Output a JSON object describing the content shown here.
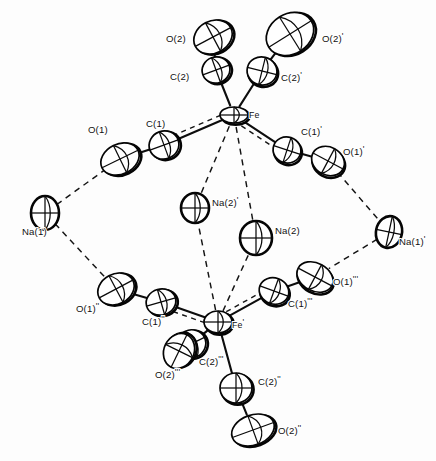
{
  "figure": {
    "name": "ortep-thermal-ellipsoid-plot",
    "type": "crystal-structure-diagram",
    "width": 436,
    "height": 461,
    "background_color": "#fdfdfd",
    "line_color": "#0d0d0d",
    "ellipsoid_fill": "#ffffff",
    "bond_style": "solid",
    "contact_style": "dashed"
  },
  "atoms": [
    {
      "id": "O2",
      "label": "O(2)",
      "element": "O",
      "cx": 213,
      "cy": 37,
      "rx": 20,
      "ry": 16,
      "rot": -28,
      "label_x": 166,
      "label_y": 42,
      "shadow": true
    },
    {
      "id": "O2p",
      "label": "O(2)",
      "prime": "'",
      "element": "O",
      "cx": 290,
      "cy": 34,
      "rx": 25,
      "ry": 20,
      "rot": -32,
      "label_x": 322,
      "label_y": 42,
      "shadow": true
    },
    {
      "id": "C2",
      "label": "C(2)",
      "element": "C",
      "cx": 216,
      "cy": 70,
      "rx": 14,
      "ry": 13,
      "rot": -20,
      "label_x": 170,
      "label_y": 80,
      "shadow": true
    },
    {
      "id": "C2p",
      "label": "C(2)",
      "prime": "'",
      "element": "C",
      "cx": 262,
      "cy": 71,
      "rx": 15,
      "ry": 14,
      "rot": 14,
      "label_x": 281,
      "label_y": 81,
      "shadow": true
    },
    {
      "id": "Fe",
      "label": "Fe",
      "element": "Fe",
      "cx": 234,
      "cy": 115,
      "rx": 14,
      "ry": 8,
      "rot": 0,
      "label_x": 249,
      "label_y": 118,
      "shadow": true
    },
    {
      "id": "C1",
      "label": "C(1)",
      "element": "C",
      "cx": 164,
      "cy": 145,
      "rx": 15,
      "ry": 14,
      "rot": -20,
      "label_x": 146,
      "label_y": 127,
      "shadow": true
    },
    {
      "id": "O1",
      "label": "O(1)",
      "element": "O",
      "cx": 120,
      "cy": 159,
      "rx": 20,
      "ry": 15,
      "rot": -26,
      "label_x": 88,
      "label_y": 133,
      "shadow": true
    },
    {
      "id": "C1p",
      "label": "C(1)",
      "prime": "'",
      "element": "C",
      "cx": 287,
      "cy": 150,
      "rx": 14,
      "ry": 13,
      "rot": 18,
      "label_x": 301,
      "label_y": 135,
      "shadow": true
    },
    {
      "id": "O1p",
      "label": "O(1)",
      "prime": "'",
      "element": "O",
      "cx": 328,
      "cy": 161,
      "rx": 17,
      "ry": 14,
      "rot": 28,
      "label_x": 343,
      "label_y": 155,
      "shadow": true
    },
    {
      "id": "Na2p",
      "label": "Na(2)",
      "prime": "'",
      "element": "Na",
      "cx": 195,
      "cy": 208,
      "rx": 14,
      "ry": 15,
      "rot": 0,
      "label_x": 212,
      "label_y": 206,
      "shadow": false
    },
    {
      "id": "Na2",
      "label": "Na(2)",
      "element": "Na",
      "cx": 256,
      "cy": 238,
      "rx": 16,
      "ry": 17,
      "rot": 0,
      "label_x": 275,
      "label_y": 234,
      "shadow": false
    },
    {
      "id": "Na1",
      "label": "Na(1)",
      "element": "Na",
      "cx": 45,
      "cy": 213,
      "rx": 14,
      "ry": 17,
      "rot": 0,
      "label_x": 22,
      "label_y": 235,
      "shadow": false
    },
    {
      "id": "Na1p",
      "label": "Na(1)",
      "prime": "'",
      "element": "Na",
      "cx": 389,
      "cy": 232,
      "rx": 13,
      "ry": 16,
      "rot": 12,
      "label_x": 399,
      "label_y": 245,
      "shadow": false
    },
    {
      "id": "O1pp",
      "label": "O(1)",
      "prime": "''",
      "element": "O",
      "cx": 116,
      "cy": 289,
      "rx": 19,
      "ry": 15,
      "rot": -28,
      "label_x": 76,
      "label_y": 312,
      "shadow": true
    },
    {
      "id": "C1pp",
      "label": "C(1)",
      "prime": "''",
      "element": "C",
      "cx": 161,
      "cy": 302,
      "rx": 15,
      "ry": 13,
      "rot": -16,
      "label_x": 142,
      "label_y": 325,
      "shadow": true
    },
    {
      "id": "Fep",
      "label": "Fe",
      "prime": "'",
      "element": "Fe",
      "cx": 218,
      "cy": 322,
      "rx": 14,
      "ry": 11,
      "rot": 0,
      "label_x": 232,
      "label_y": 328,
      "shadow": true
    },
    {
      "id": "C1ppp",
      "label": "C(1)",
      "prime": "'''",
      "element": "C",
      "cx": 274,
      "cy": 291,
      "rx": 15,
      "ry": 13,
      "rot": 20,
      "label_x": 288,
      "label_y": 307,
      "shadow": true
    },
    {
      "id": "O1ppp",
      "label": "O(1)",
      "prime": "'''",
      "element": "O",
      "cx": 315,
      "cy": 277,
      "rx": 19,
      "ry": 14,
      "rot": 28,
      "label_x": 333,
      "label_y": 285,
      "shadow": true
    },
    {
      "id": "C2ppp",
      "label": "C(2)",
      "prime": "'''",
      "element": "C",
      "cx": 191,
      "cy": 344,
      "rx": 15,
      "ry": 14,
      "rot": -26,
      "label_x": 199,
      "label_y": 365,
      "shadow": true
    },
    {
      "id": "O2ppp",
      "label": "O(2)",
      "prime": "'''",
      "element": "O",
      "cx": 179,
      "cy": 351,
      "rx": 18,
      "ry": 15,
      "rot": -64,
      "label_x": 155,
      "label_y": 378,
      "shadow": true
    },
    {
      "id": "C2pp",
      "label": "C(2)",
      "prime": "''",
      "element": "C",
      "cx": 236,
      "cy": 388,
      "rx": 16,
      "ry": 15,
      "rot": 0,
      "label_x": 258,
      "label_y": 385,
      "shadow": true
    },
    {
      "id": "O2pp",
      "label": "O(2)",
      "prime": "''",
      "element": "O",
      "cx": 253,
      "cy": 430,
      "rx": 22,
      "ry": 15,
      "rot": -20,
      "label_x": 278,
      "label_y": 434,
      "shadow": true
    }
  ],
  "bonds": [
    {
      "name": "bond-O2-C2",
      "from": "O2",
      "to": "C2",
      "style": "solid"
    },
    {
      "name": "bond-O2p-C2p",
      "from": "O2p",
      "to": "C2p",
      "style": "solid"
    },
    {
      "name": "bond-C2-Fe",
      "from": "C2",
      "to": "Fe",
      "style": "solid"
    },
    {
      "name": "bond-C2p-Fe",
      "from": "C2p",
      "to": "Fe",
      "style": "solid"
    },
    {
      "name": "bond-Fe-C1",
      "from": "Fe",
      "to": "C1",
      "style": "solid"
    },
    {
      "name": "bond-C1-O1",
      "from": "C1",
      "to": "O1",
      "style": "solid"
    },
    {
      "name": "bond-Fe-C1p",
      "from": "Fe",
      "to": "C1p",
      "style": "solid"
    },
    {
      "name": "bond-C1p-O1p",
      "from": "C1p",
      "to": "O1p",
      "style": "solid"
    },
    {
      "name": "bond-Fep-C1pp",
      "from": "Fep",
      "to": "C1pp",
      "style": "solid"
    },
    {
      "name": "bond-C1pp-O1pp",
      "from": "C1pp",
      "to": "O1pp",
      "style": "solid"
    },
    {
      "name": "bond-Fep-C1ppp",
      "from": "Fep",
      "to": "C1ppp",
      "style": "solid"
    },
    {
      "name": "bond-C1ppp-O1ppp",
      "from": "C1ppp",
      "to": "O1ppp",
      "style": "solid"
    },
    {
      "name": "bond-Fep-C2ppp",
      "from": "Fep",
      "to": "C2ppp",
      "style": "solid"
    },
    {
      "name": "bond-C2ppp-O2ppp",
      "from": "C2ppp",
      "to": "O2ppp",
      "style": "solid"
    },
    {
      "name": "bond-Fep-C2pp",
      "from": "Fep",
      "to": "C2pp",
      "style": "solid"
    },
    {
      "name": "bond-C2pp-O2pp",
      "from": "C2pp",
      "to": "O2pp",
      "style": "solid"
    }
  ],
  "contacts": [
    {
      "name": "contact-O1-Na1",
      "from": "O1",
      "to": "Na1"
    },
    {
      "name": "contact-Na1-O1pp",
      "from": "Na1",
      "to": "O1pp"
    },
    {
      "name": "contact-O1p-Na1p",
      "from": "O1p",
      "to": "Na1p"
    },
    {
      "name": "contact-Na1p-O1ppp",
      "from": "Na1p",
      "to": "O1ppp"
    },
    {
      "name": "contact-Fe-Na2p",
      "from": "Fe",
      "to": "Na2p"
    },
    {
      "name": "contact-Fe-Na2",
      "from": "Fe",
      "to": "Na2"
    },
    {
      "name": "contact-Fep-Na2p",
      "from": "Fep",
      "to": "Na2p"
    },
    {
      "name": "contact-Fep-Na2",
      "from": "Fep",
      "to": "Na2"
    },
    {
      "name": "contact-Fe-C1-edge",
      "from": "Fe",
      "to": "C1",
      "offset": 5
    },
    {
      "name": "contact-Fe-C1p-edge",
      "from": "Fe",
      "to": "C1p",
      "offset": 5
    },
    {
      "name": "contact-Fep-C1pp-edge",
      "from": "Fep",
      "to": "C1pp",
      "offset": -5
    },
    {
      "name": "contact-Fep-C1ppp-edge",
      "from": "Fep",
      "to": "C1ppp",
      "offset": -5
    }
  ]
}
